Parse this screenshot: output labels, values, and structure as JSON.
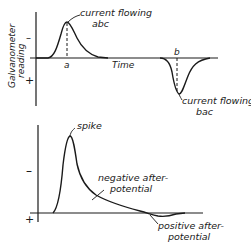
{
  "top_graph": {
    "y_axis_label_line1": "Galvanometer",
    "y_axis_label_line2": "reading",
    "y_minus": "–",
    "y_plus": "+",
    "x_axis_label": "Time",
    "point_a": "a",
    "point_b": "b",
    "peak_label_line1": "current flowing",
    "peak_label_line2": "abc",
    "trough_label_line1": "current flowing",
    "trough_label_line2": "bac"
  },
  "bottom_graph": {
    "y_minus": "–",
    "y_plus": "+",
    "spike_label": "spike",
    "negative_label_line1": "negative after-",
    "negative_label_line2": "potential",
    "positive_label_line1": "positive after-",
    "positive_label_line2": "potential"
  },
  "colors": {
    "ink": "#1a1a1a",
    "background": "#ffffff"
  }
}
